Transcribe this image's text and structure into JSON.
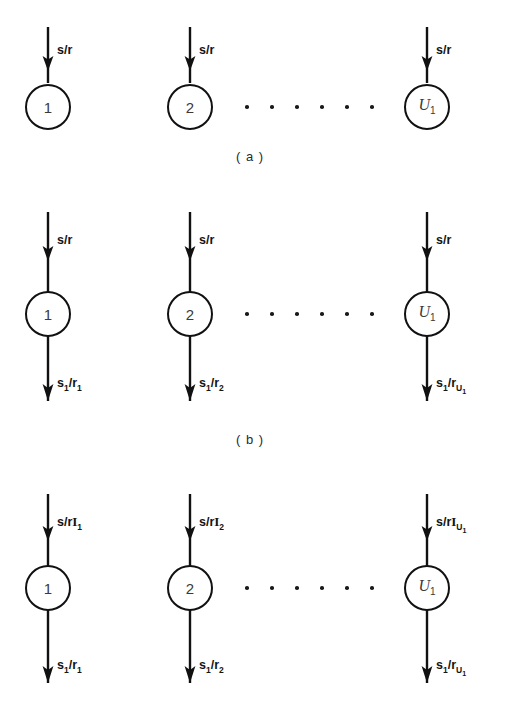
{
  "figure": {
    "background_color": "#ffffff",
    "stroke_color": "#111111",
    "panels": [
      {
        "id": "a",
        "caption": "( a )",
        "nodes": [
          {
            "label": "1",
            "style": "plain"
          },
          {
            "label": "2",
            "style": "plain"
          },
          {
            "label": "U",
            "sub": "1",
            "style": "italic"
          }
        ],
        "inputs": [
          {
            "text": "s/r"
          },
          {
            "text": "s/r"
          },
          {
            "text": "s/r"
          }
        ],
        "outputs": [],
        "ellipsis_dots": 6
      },
      {
        "id": "b",
        "caption": "( b )",
        "nodes": [
          {
            "label": "1",
            "style": "plain"
          },
          {
            "label": "2",
            "style": "plain"
          },
          {
            "label": "U",
            "sub": "1",
            "style": "italic"
          }
        ],
        "inputs": [
          {
            "text": "s/r"
          },
          {
            "text": "s/r"
          },
          {
            "text": "s/r"
          }
        ],
        "outputs": [
          {
            "num": "s",
            "num_sub": "1",
            "den": "r",
            "den_sub": "1"
          },
          {
            "num": "s",
            "num_sub": "1",
            "den": "r",
            "den_sub": "2"
          },
          {
            "num": "s",
            "num_sub": "1",
            "den": "r",
            "den_sub": "U",
            "den_sub2": "1"
          }
        ],
        "ellipsis_dots": 6
      },
      {
        "id": "c",
        "caption": "",
        "nodes": [
          {
            "label": "1",
            "style": "plain"
          },
          {
            "label": "2",
            "style": "plain"
          },
          {
            "label": "U",
            "sub": "1",
            "style": "italic"
          }
        ],
        "inputs": [
          {
            "prefix": "s/r",
            "symbol": "I",
            "sub": "1"
          },
          {
            "prefix": "s/r",
            "symbol": "I",
            "sub": "2"
          },
          {
            "prefix": "s/r",
            "symbol": "I",
            "sub": "U",
            "sub2": "1"
          }
        ],
        "outputs": [
          {
            "num": "s",
            "num_sub": "1",
            "den": "r",
            "den_sub": "1"
          },
          {
            "num": "s",
            "num_sub": "1",
            "den": "r",
            "den_sub": "2"
          },
          {
            "num": "s",
            "num_sub": "1",
            "den": "r",
            "den_sub": "U",
            "den_sub2": "1"
          }
        ],
        "ellipsis_dots": 6
      }
    ]
  }
}
